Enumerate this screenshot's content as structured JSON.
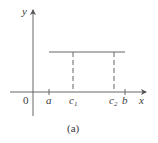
{
  "diagram": {
    "caption": "(a)",
    "axes": {
      "x_label": "x",
      "y_label": "y",
      "origin_label": "0"
    },
    "ticks": [
      {
        "label": "a",
        "sub": ""
      },
      {
        "label": "c",
        "sub": "1"
      },
      {
        "label": "c",
        "sub": "2"
      },
      {
        "label": "b",
        "sub": ""
      }
    ],
    "colors": {
      "line": "#555555",
      "text": "#3a3a3a"
    }
  }
}
